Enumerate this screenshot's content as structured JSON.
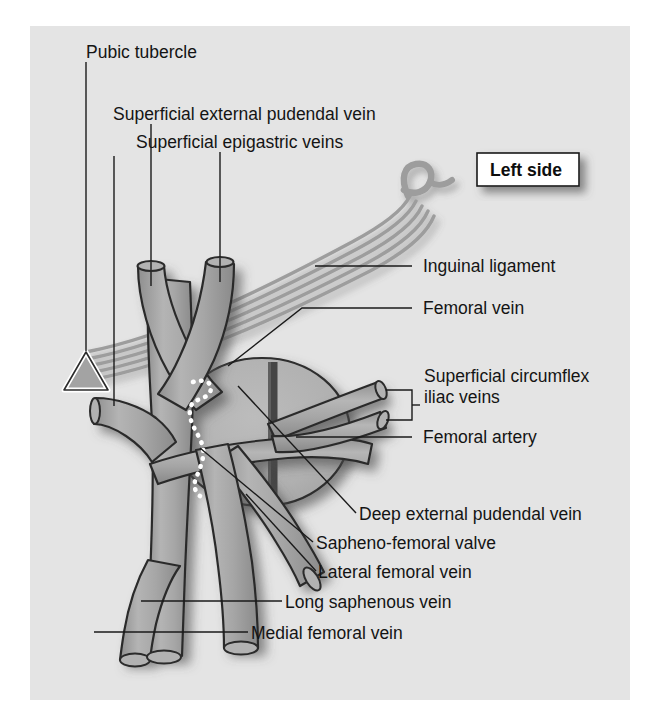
{
  "figure": {
    "domain": "anatomical-diagram",
    "title_badge": "Left side",
    "background_color": "#ffffff",
    "panel_color": "#e3e3e3",
    "vessel_fill": "#a9a9a9",
    "vessel_stroke": "#2b2b2b",
    "text_color": "#141414",
    "ligament_color": "#9b9b9b",
    "artery_band_color": "#4a4a4a",
    "valve_dot_color": "#ffffff"
  },
  "badge": {
    "label": "Left side"
  },
  "labels": {
    "pubic_tubercle": "Pubic tubercle",
    "superficial_external_pudendal_vein": "Superficial external pudendal vein",
    "superficial_epigastric_veins": "Superficial epigastric veins",
    "inguinal_ligament": "Inguinal ligament",
    "femoral_vein": "Femoral vein",
    "superficial_circumflex_iliac_veins_line1": "Superficial circumflex",
    "superficial_circumflex_iliac_veins_line2": "iliac veins",
    "femoral_artery": "Femoral artery",
    "deep_external_pudendal_vein": "Deep external pudendal vein",
    "sapheno_femoral_valve": "Sapheno-femoral valve",
    "lateral_femoral_vein": "Lateral femoral vein",
    "long_saphenous_vein": "Long saphenous vein",
    "medial_femoral_vein": "Medial femoral vein"
  },
  "structures": [
    {
      "name": "pubic-tubercle-marker",
      "kind": "triangle-marker"
    },
    {
      "name": "inguinal-ligament",
      "kind": "striped-fibrous-band"
    },
    {
      "name": "femoral-region-oval",
      "kind": "oval"
    },
    {
      "name": "femoral-artery-band",
      "kind": "vertical-band"
    },
    {
      "name": "sapheno-femoral-valve",
      "kind": "dotted-line"
    },
    {
      "name": "long-saphenous-vein",
      "kind": "vessel-trunk"
    },
    {
      "name": "femoral-vein",
      "kind": "vessel-trunk"
    },
    {
      "name": "superficial-epigastric-vein",
      "kind": "vessel-branch"
    },
    {
      "name": "superficial-external-pudendal-vein",
      "kind": "vessel-branch"
    },
    {
      "name": "superficial-circumflex-iliac-vein-upper",
      "kind": "vessel-branch"
    },
    {
      "name": "superficial-circumflex-iliac-vein-lower",
      "kind": "vessel-branch"
    },
    {
      "name": "deep-external-pudendal-vein",
      "kind": "vessel-branch"
    },
    {
      "name": "lateral-femoral-vein",
      "kind": "vessel-branch"
    },
    {
      "name": "medial-femoral-vein",
      "kind": "vessel-branch"
    }
  ]
}
